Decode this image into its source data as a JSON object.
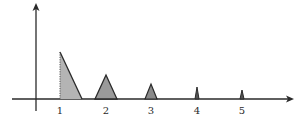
{
  "diagram": {
    "colors": {
      "stroke": "#2a2a2a",
      "fill": "#9a9a9a",
      "background": "#ffffff"
    },
    "axes": {
      "x_axis": {
        "x1": 12,
        "x2": 293,
        "y": 99,
        "arrow": true
      },
      "y_axis": {
        "x": 36,
        "y1": 111,
        "y2": 4,
        "arrow": true
      }
    },
    "tick_labels": [
      {
        "text": "1",
        "x": 60
      },
      {
        "text": "2",
        "x": 106
      },
      {
        "text": "3",
        "x": 151
      },
      {
        "text": "4",
        "x": 197
      },
      {
        "text": "5",
        "x": 242
      }
    ],
    "pulses": [
      {
        "label": "1",
        "shape": "right-triangle",
        "points": "60,99 60,52 82,99",
        "dotted_edge": true
      },
      {
        "label": "2",
        "shape": "triangle",
        "points": "95,99 106,75 117,99"
      },
      {
        "label": "3",
        "shape": "triangle",
        "points": "145,99 151,84 157,99"
      },
      {
        "label": "4",
        "shape": "triangle",
        "points": "195,99 197,87 199,99"
      },
      {
        "label": "5",
        "shape": "triangle",
        "points": "240,99 242,90 244,99"
      }
    ]
  },
  "labels": {
    "t1": "1",
    "t2": "2",
    "t3": "3",
    "t4": "4",
    "t5": "5"
  }
}
